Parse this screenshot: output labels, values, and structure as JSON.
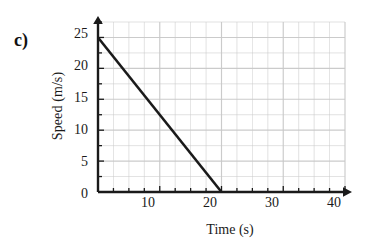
{
  "figure": {
    "part_label": "c)"
  },
  "chart_data": {
    "type": "line",
    "title": "",
    "xlabel": "Time (s)",
    "ylabel": "Speed (m/s)",
    "xlim": [
      0,
      40
    ],
    "ylim": [
      0,
      27.5
    ],
    "xticks": [
      0,
      10,
      20,
      30,
      40
    ],
    "xtick_labels": [
      "0",
      "10",
      "20",
      "30",
      "40"
    ],
    "yticks": [
      0,
      5,
      10,
      15,
      20,
      25
    ],
    "ytick_labels": [
      "0",
      "5",
      "10",
      "15",
      "20",
      "25"
    ],
    "grid": true,
    "grid_spacing_x": 2.5,
    "grid_spacing_y": 2.5,
    "grid_color": "#c9c9c9",
    "legend": null,
    "axis_arrows": true,
    "series": [
      {
        "name": "Speed",
        "color": "#1a1a1a",
        "x": [
          0,
          20
        ],
        "values": [
          25,
          0
        ],
        "points": [
          [
            0,
            25
          ],
          [
            20,
            0
          ]
        ]
      }
    ]
  }
}
